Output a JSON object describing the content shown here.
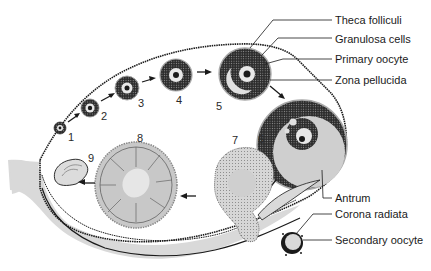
{
  "diagram": {
    "stage_numbers": [
      "1",
      "2",
      "3",
      "4",
      "5",
      "6",
      "7",
      "8",
      "9"
    ],
    "labels": {
      "theca_folliculi": "Theca folliculi",
      "granulosa_cells": "Granulosa cells",
      "primary_oocyte": "Primary oocyte",
      "zona_pellucida": "Zona pellucida",
      "antrum": "Antrum",
      "corona_radiata": "Corona radiata",
      "secondary_oocyte": "Secondary oocyte"
    },
    "colors": {
      "background": "#ffffff",
      "line": "#1a1a1a",
      "dark_cells": "#2b2b2b",
      "light_fill": "#d9d9d9",
      "mid_fill": "#bdbdbd"
    }
  }
}
